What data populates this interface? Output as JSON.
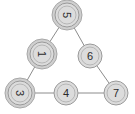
{
  "figure": {
    "type": "node-link-graph",
    "background_color": "#ffffff",
    "width": 135,
    "height": 114
  },
  "style": {
    "node_fill": "#dcdcdc",
    "node_stroke": "#9a9a9a",
    "node_inner_ring_stroke": "#b6b6b6",
    "node_halo_fill": "#cfcfcf",
    "node_halo_stroke": "#a8a8a8",
    "edge_stroke": "#8c8c8c",
    "label_color": "#2b2b2b",
    "node_radius": 12,
    "halo_radius": 15,
    "inner_ring_radius": 9,
    "edge_width": 1
  },
  "chart_data": {
    "type": "graph",
    "title": "",
    "nodes": [
      {
        "id": "n0",
        "label": "5",
        "x": 67,
        "y": 15,
        "rotation": 90,
        "halo": true
      },
      {
        "id": "n1",
        "label": "1",
        "x": 42,
        "y": 54,
        "rotation": 90,
        "halo": true
      },
      {
        "id": "n2",
        "label": "6",
        "x": 90,
        "y": 56,
        "rotation": 0,
        "halo": false
      },
      {
        "id": "n3",
        "label": "3",
        "x": 20,
        "y": 93,
        "rotation": 90,
        "halo": true
      },
      {
        "id": "n4",
        "label": "4",
        "x": 66,
        "y": 93,
        "rotation": 0,
        "halo": false
      },
      {
        "id": "n5",
        "label": "7",
        "x": 116,
        "y": 93,
        "rotation": 0,
        "halo": false
      }
    ],
    "edges": [
      {
        "source": "n0",
        "target": "n1"
      },
      {
        "source": "n0",
        "target": "n2"
      },
      {
        "source": "n1",
        "target": "n3"
      },
      {
        "source": "n2",
        "target": "n5"
      },
      {
        "source": "n3",
        "target": "n4"
      },
      {
        "source": "n4",
        "target": "n5"
      }
    ]
  }
}
